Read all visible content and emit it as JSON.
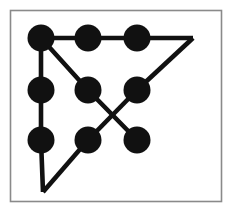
{
  "figure": {
    "canvas": {
      "width": 230,
      "height": 216,
      "background": "#ffffff"
    },
    "frame": {
      "name": "image-border",
      "x": 10.5,
      "y": 10.5,
      "width": 211,
      "height": 191,
      "stroke": "#8a8a8a",
      "stroke_width": 1.6,
      "fill": "#ffffff"
    },
    "style": {
      "dot_color": "#111111",
      "line_color": "#111111",
      "dot_radius": 13.5,
      "line_width": 4.6,
      "line_cap": "butt",
      "line_join": "miter"
    },
    "grid": {
      "rows": 3,
      "columns": 3,
      "column_x": [
        41,
        88,
        137
      ],
      "row_y": [
        38,
        90,
        140
      ],
      "count": 9
    },
    "dots": [
      {
        "id": "dot-top-left",
        "label": "top-left",
        "row": 0,
        "col": 0,
        "cx": 41,
        "cy": 38
      },
      {
        "id": "dot-top-center",
        "label": "top-center",
        "row": 0,
        "col": 1,
        "cx": 88,
        "cy": 38
      },
      {
        "id": "dot-top-right",
        "label": "top-right",
        "row": 0,
        "col": 2,
        "cx": 137,
        "cy": 38
      },
      {
        "id": "dot-middle-left",
        "label": "middle-left",
        "row": 1,
        "col": 0,
        "cx": 41,
        "cy": 90
      },
      {
        "id": "dot-middle-center",
        "label": "middle-center",
        "row": 1,
        "col": 1,
        "cx": 88,
        "cy": 90
      },
      {
        "id": "dot-middle-right",
        "label": "middle-right",
        "row": 1,
        "col": 2,
        "cx": 137,
        "cy": 90
      },
      {
        "id": "dot-bottom-left",
        "label": "bottom-left",
        "row": 2,
        "col": 0,
        "cx": 41,
        "cy": 140
      },
      {
        "id": "dot-bottom-center",
        "label": "bottom-center",
        "row": 2,
        "col": 1,
        "cx": 88,
        "cy": 140
      },
      {
        "id": "dot-bottom-right",
        "label": "bottom-right",
        "row": 2,
        "col": 2,
        "cx": 137,
        "cy": 140
      }
    ],
    "apex_points": [
      {
        "id": "apex-right",
        "label": "right-apex-outside-grid",
        "x": 193,
        "y": 38
      },
      {
        "id": "apex-bottom",
        "label": "bottom-apex-outside-grid",
        "x": 43,
        "y": 192
      }
    ],
    "paths": [
      {
        "id": "path-top-horizontal",
        "label": "top row rightward to right apex",
        "points": "41,38 88,38 137,38 193,38"
      },
      {
        "id": "path-right-diagonal",
        "label": "right apex down-left to middle-right dot",
        "points": "193,38 137,90"
      },
      {
        "id": "path-middle-right-to-bottom-center",
        "label": "middle-right dot down-left to bottom-center dot",
        "points": "137,90 88,140"
      },
      {
        "id": "path-bottom-center-to-bottom-apex",
        "label": "bottom-center dot down-left to bottom apex",
        "points": "88,140 43,192"
      },
      {
        "id": "path-bottom-apex-to-top-left",
        "label": "bottom apex up the left column through bottom-left and middle-left to top-left",
        "points": "43,192 41,140 41,90 41,38"
      },
      {
        "id": "path-top-left-to-bottom-right",
        "label": "top-left dot diagonally through middle-center to bottom-right dot",
        "points": "41,38 88,90 137,140"
      }
    ]
  }
}
